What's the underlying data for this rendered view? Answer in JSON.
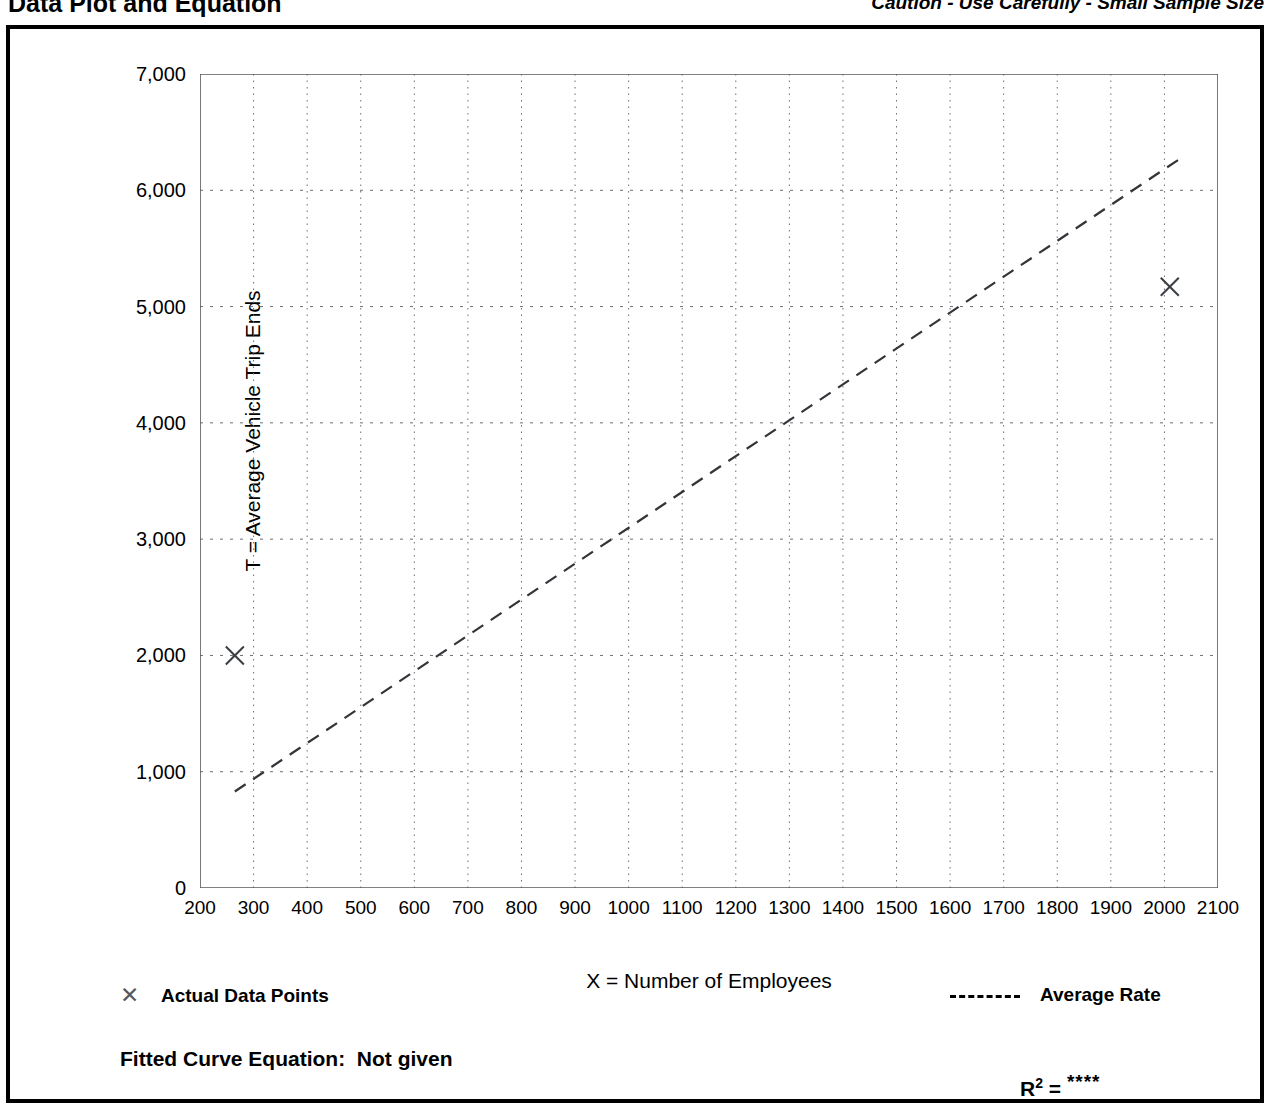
{
  "header": {
    "title": "Data Plot and Equation",
    "caution": "Caution - Use Carefully - Small Sample Size"
  },
  "legend": {
    "points_marker": "✕",
    "points_label": "Actual Data Points",
    "line_label": "Average Rate"
  },
  "footer": {
    "equation_label": "Fitted Curve Equation:  Not given",
    "r_squared_symbol": "R",
    "r_squared_exponent": "2",
    "r_squared_equals": " = ",
    "r_squared_value": "****"
  },
  "chart_data": {
    "type": "scatter",
    "title": "Data Plot and Equation",
    "xlabel": "X = Number of Employees",
    "ylabel": "T = Average Vehicle Trip Ends",
    "xlim": [
      200,
      2100
    ],
    "ylim": [
      0,
      7000
    ],
    "grid": true,
    "x_ticks": [
      200,
      300,
      400,
      500,
      600,
      700,
      800,
      900,
      1000,
      1100,
      1200,
      1300,
      1400,
      1500,
      1600,
      1700,
      1800,
      1900,
      2000,
      2100
    ],
    "x_tick_labels": [
      "200",
      "300",
      "400",
      "500",
      "600",
      "700",
      "800",
      "900",
      "1000",
      "1100",
      "1200",
      "1300",
      "1400",
      "1500",
      "1600",
      "1700",
      "1800",
      "1900",
      "2000",
      "2100"
    ],
    "x_minor_tick_interval": 50,
    "y_ticks": [
      0,
      1000,
      2000,
      3000,
      4000,
      5000,
      6000,
      7000
    ],
    "y_tick_labels": [
      "0",
      "1,000",
      "2,000",
      "3,000",
      "4,000",
      "5,000",
      "6,000",
      "7,000"
    ],
    "y_minor_tick_interval": 500,
    "series": [
      {
        "name": "Actual Data Points",
        "type": "scatter",
        "marker": "x",
        "points": [
          {
            "x": 265,
            "y": 2000
          },
          {
            "x": 2010,
            "y": 5170
          }
        ]
      },
      {
        "name": "Average Rate",
        "type": "line",
        "style": "dashed",
        "points": [
          {
            "x": 265,
            "y": 830
          },
          {
            "x": 2035,
            "y": 6290
          }
        ],
        "note": "Average rate line through origin; slope approximately 3.1 trip ends per employee"
      }
    ],
    "legend_position": "below-plot",
    "annotations": [
      {
        "text": "Caution - Use Carefully - Small Sample Size",
        "position": "top-right"
      },
      {
        "text": "Fitted Curve Equation:  Not given",
        "position": "bottom-left"
      },
      {
        "text": "R2 = ****",
        "position": "bottom-right"
      }
    ]
  }
}
